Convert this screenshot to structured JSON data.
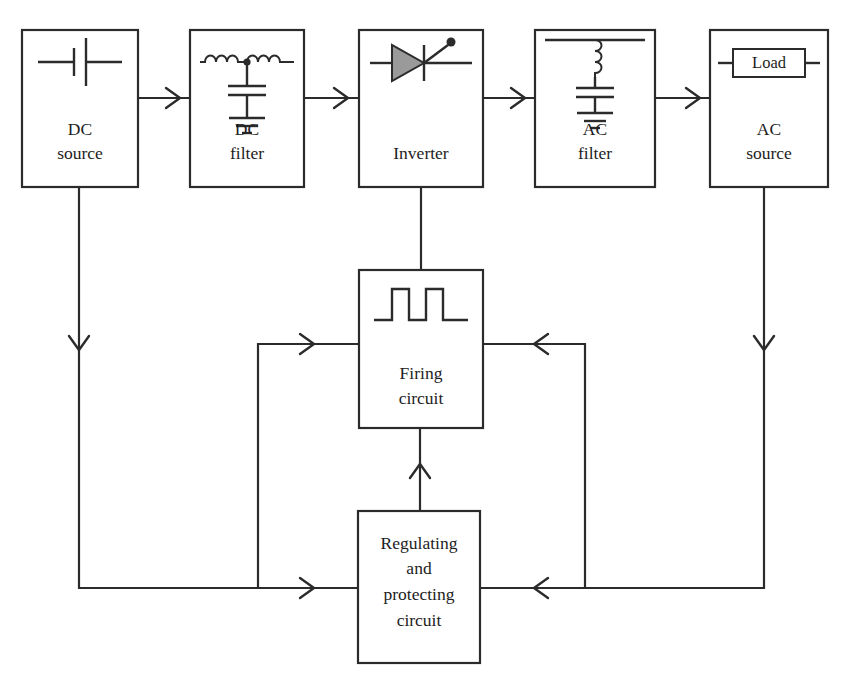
{
  "diagram": {
    "stroke_color": "#2b2b2b",
    "background_color": "#ffffff",
    "symbol_fill_color": "#9a9a9a",
    "blocks": [
      {
        "id": "dc-source",
        "label_line1": "DC",
        "label_line2": "source",
        "symbol": "battery-cell-icon"
      },
      {
        "id": "dc-filter",
        "label_line1": "DC",
        "label_line2": "filter",
        "symbol": "lc-pi-filter-icon"
      },
      {
        "id": "inverter",
        "label_line1": "Inverter",
        "label_line2": "",
        "symbol": "thyristor-icon"
      },
      {
        "id": "ac-filter",
        "label_line1": "AC",
        "label_line2": "filter",
        "symbol": "lc-shunt-filter-icon"
      },
      {
        "id": "ac-source",
        "label_line1": "AC",
        "label_line2": "source",
        "symbol": "load-resistor-icon",
        "inner_label": "Load"
      },
      {
        "id": "firing-circuit",
        "label_line1": "Firing",
        "label_line2": "circuit",
        "symbol": "pulse-train-icon"
      },
      {
        "id": "regulating-circuit",
        "label_line1": "Regulating",
        "label_line2": "and",
        "label_line3": "protecting",
        "label_line4": "circuit",
        "symbol": "none"
      }
    ],
    "connections": [
      {
        "id": "dc-source-to-dc-filter",
        "from": "dc-source",
        "to": "dc-filter",
        "arrow": "right"
      },
      {
        "id": "dc-filter-to-inverter",
        "from": "dc-filter",
        "to": "inverter",
        "arrow": "right"
      },
      {
        "id": "inverter-to-ac-filter",
        "from": "inverter",
        "to": "ac-filter",
        "arrow": "right"
      },
      {
        "id": "ac-filter-to-ac-source",
        "from": "ac-filter",
        "to": "ac-source",
        "arrow": "right"
      },
      {
        "id": "inverter-to-firing-circuit",
        "from": "inverter",
        "to": "firing-circuit",
        "arrow": "none"
      },
      {
        "id": "regulating-to-firing",
        "from": "regulating-circuit",
        "to": "firing-circuit",
        "arrow": "up"
      },
      {
        "id": "dc-source-feedback",
        "from": "dc-source",
        "to": "regulating-circuit",
        "arrow": "down-then-right"
      },
      {
        "id": "ac-source-feedback",
        "from": "ac-source",
        "to": "regulating-circuit",
        "arrow": "down-then-left"
      },
      {
        "id": "regulating-left-branch-to-firing",
        "from": "regulating-circuit",
        "to": "firing-circuit",
        "arrow": "right"
      },
      {
        "id": "regulating-right-branch-to-firing",
        "from": "regulating-circuit",
        "to": "firing-circuit",
        "arrow": "left"
      }
    ]
  }
}
